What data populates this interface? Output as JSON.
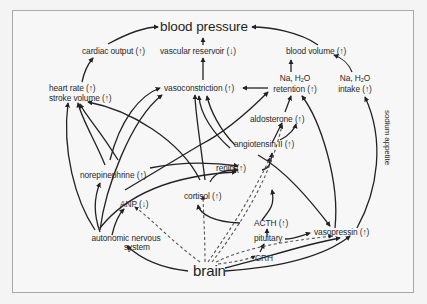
{
  "diagram": {
    "title": "blood pressure",
    "nodes": {
      "blood_pressure": "blood pressure",
      "cardiac_output": "cardiac output (↑)",
      "vascular_reservoir": "vascular reservoir (↓)",
      "blood_volume": "blood volume (↑)",
      "heart_rate": "heart rate (↑)",
      "stroke_volume": "stroke volume (↑)",
      "vasoconstriction": "vasoconstriction (↑)",
      "na_h2o_retention_line1": "Na, H",
      "na_h2o_retention_sub": "2",
      "na_h2o_retention_line1_end": "O",
      "na_h2o_retention_line2": "retention (↑)",
      "na_h2o_intake_line1": "Na, H",
      "na_h2o_intake_sub": "2",
      "na_h2o_intake_line1_end": "O",
      "na_h2o_intake_line2": "intake (↑)",
      "aldosterone": "aldosterone (↑)",
      "angiotensin_ii": "angiotensin II (↑)",
      "norepinephrine": "norepinephrine (↑)",
      "renin": "renin (↑)",
      "cortisol": "cortisol (↑)",
      "anp": "ANP (↓)",
      "acth": "ACTH (↑)",
      "pituitary": "pituitary",
      "vasopressin": "vasopressin (↑)",
      "crh": "CRH",
      "autonomic_line1": "autonomic nervous",
      "autonomic_line2": "system",
      "brain": "brain"
    },
    "edge_labels": {
      "sodium_appetite": "sodium appetite"
    },
    "edge_styles": {
      "solid": "direct effect",
      "dashed": "neural/hormonal signal from brain"
    },
    "colors": {
      "line": "#222222",
      "text": "#2a2a2a",
      "frame": "#a8a8a8",
      "background": "#f7f7f7"
    }
  }
}
